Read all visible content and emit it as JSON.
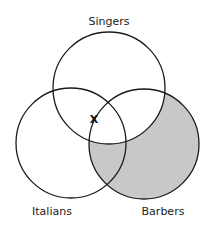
{
  "diagram": {
    "type": "venn-3",
    "circles": [
      {
        "id": "singers",
        "label": "Singers",
        "cx": 109,
        "cy": 88,
        "r": 56
      },
      {
        "id": "italians",
        "label": "Italians",
        "cx": 71,
        "cy": 143,
        "r": 55
      },
      {
        "id": "barbers",
        "label": "Barbers",
        "cx": 144,
        "cy": 144,
        "r": 55
      }
    ],
    "shaded_region": "Barbers not Singers",
    "shade_color": "#c8c8c8",
    "stroke_color": "#1a1a1a",
    "marker": {
      "symbol": "X",
      "x": 94,
      "y": 119,
      "location": "on Barbers boundary within Singers and Italians"
    }
  }
}
